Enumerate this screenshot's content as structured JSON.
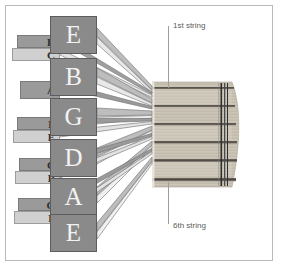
{
  "diagram": {
    "type": "guitar-tuning-diagram",
    "background_color": "#ffffff",
    "frame_color": "#b9b9b9"
  },
  "strings": [
    {
      "index": 1,
      "note": "E",
      "ordinal": "1st string"
    },
    {
      "index": 2,
      "note": "B",
      "ordinal": "2nd string"
    },
    {
      "index": 3,
      "note": "G",
      "ordinal": "3rd string"
    },
    {
      "index": 4,
      "note": "D",
      "ordinal": "4th string"
    },
    {
      "index": 5,
      "note": "A",
      "ordinal": "5th string"
    },
    {
      "index": 6,
      "note": "E",
      "ordinal": "6th string"
    }
  ],
  "main_notes": [
    {
      "label": "E",
      "x": 50,
      "y": 16
    },
    {
      "label": "B",
      "x": 50,
      "y": 58
    },
    {
      "label": "G",
      "x": 50,
      "y": 98
    },
    {
      "label": "D",
      "x": 50,
      "y": 139
    },
    {
      "label": "A",
      "x": 50,
      "y": 178
    },
    {
      "label": "E",
      "x": 50,
      "y": 214
    }
  ],
  "small_notes": [
    {
      "label": "D",
      "x": 17,
      "y": 35,
      "w": 43,
      "shade": "dark"
    },
    {
      "label": "C",
      "x": 12,
      "y": 48,
      "w": 48,
      "shade": "light"
    },
    {
      "label": "A",
      "x": 20,
      "y": 81,
      "w": 40,
      "shade": "dark"
    },
    {
      "label": "F",
      "x": 17,
      "y": 117,
      "w": 43,
      "shade": "dark"
    },
    {
      "label": "E",
      "x": 13,
      "y": 130,
      "w": 47,
      "shade": "light"
    },
    {
      "label": "C",
      "x": 19,
      "y": 158,
      "w": 41,
      "shade": "dark"
    },
    {
      "label": "B",
      "x": 15,
      "y": 171,
      "w": 45,
      "shade": "light"
    },
    {
      "label": "G",
      "x": 18,
      "y": 198,
      "w": 42,
      "shade": "dark"
    },
    {
      "label": "F",
      "x": 14,
      "y": 211,
      "w": 46,
      "shade": "light"
    }
  ],
  "callouts": {
    "first_string": {
      "label": "1st string",
      "x": 171,
      "y": 22,
      "line_top": 26,
      "line_height": 62
    },
    "sixth_string": {
      "label": "6th string",
      "x": 171,
      "y": 222,
      "line_top": 182,
      "line_height": 42
    }
  },
  "colors": {
    "note_box_fill": "#8a8a8a",
    "note_box_border": "#5d5d5d",
    "note_box_text": "#f2f2f2",
    "small_dark_fill": "#9a9a9a",
    "small_light_fill": "#d0d0d0",
    "ribbon_dark": "#9a9a9a",
    "ribbon_light": "#e6e6e6",
    "ribbon_stroke": "#6f6f6f",
    "fretboard_wood": "#c8c2b4",
    "string_line": "#4a4540",
    "nut_line": "#3a3a3a",
    "callout_text": "#5b5b5b",
    "callout_line": "#9d9d9d"
  }
}
